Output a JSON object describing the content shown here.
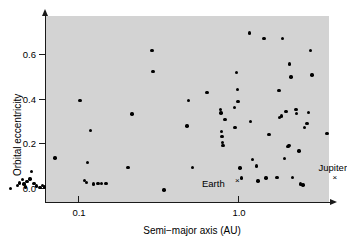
{
  "chart_data": {
    "type": "scatter",
    "title": "",
    "xlabel": "Semi−major axis (AU)",
    "ylabel": "Orbital eccentricity",
    "xscale": "log",
    "yscale": "linear",
    "xlim": [
      0.033,
      6.2
    ],
    "ylim": [
      -0.035,
      0.75
    ],
    "grid": false,
    "legend": false,
    "xticks": [
      0.1,
      1.0
    ],
    "xticklabels": [
      "0.1",
      "1.0"
    ],
    "yticks": [
      0.0,
      0.2,
      0.4,
      0.6
    ],
    "yticklabels": [
      "0.0",
      "0.2",
      "0.4",
      "0.6"
    ],
    "series": [
      {
        "name": "exoplanets",
        "marker": "filled-circle",
        "color": "#000000",
        "points": [
          [
            0.038,
            0.0
          ],
          [
            0.042,
            0.012
          ],
          [
            0.043,
            0.024
          ],
          [
            0.045,
            0.038
          ],
          [
            0.046,
            0.018
          ],
          [
            0.047,
            0.005
          ],
          [
            0.048,
            0.03
          ],
          [
            0.05,
            0.042
          ],
          [
            0.051,
            0.075
          ],
          [
            0.053,
            0.02
          ],
          [
            0.055,
            0.01
          ],
          [
            0.058,
            0.004
          ],
          [
            0.06,
            0.012
          ],
          [
            0.062,
            0.005
          ],
          [
            0.072,
            0.135
          ],
          [
            0.103,
            0.395
          ],
          [
            0.11,
            0.035
          ],
          [
            0.113,
            0.025
          ],
          [
            0.115,
            0.115
          ],
          [
            0.12,
            0.26
          ],
          [
            0.125,
            0.018
          ],
          [
            0.133,
            0.02
          ],
          [
            0.14,
            0.022
          ],
          [
            0.15,
            0.02
          ],
          [
            0.205,
            0.093
          ],
          [
            0.218,
            0.333
          ],
          [
            0.29,
            0.62
          ],
          [
            0.295,
            0.525
          ],
          [
            0.345,
            -0.008
          ],
          [
            0.48,
            0.28
          ],
          [
            0.49,
            0.395
          ],
          [
            0.52,
            0.093
          ],
          [
            0.64,
            0.43
          ],
          [
            0.78,
            0.355
          ],
          [
            0.785,
            0.338
          ],
          [
            0.79,
            0.255
          ],
          [
            0.795,
            0.232
          ],
          [
            0.8,
            0.205
          ],
          [
            0.805,
            0.192
          ],
          [
            0.83,
            0.31
          ],
          [
            0.95,
            0.363
          ],
          [
            0.96,
            0.272
          ],
          [
            0.98,
            0.52
          ],
          [
            0.99,
            0.443
          ],
          [
            1.0,
            0.39
          ],
          [
            1.03,
            0.09
          ],
          [
            1.05,
            0.045
          ],
          [
            1.18,
            0.698
          ],
          [
            1.2,
            0.3
          ],
          [
            1.23,
            0.13
          ],
          [
            1.3,
            0.1
          ],
          [
            1.33,
            0.032
          ],
          [
            1.45,
            0.672
          ],
          [
            1.5,
            0.045
          ],
          [
            1.56,
            0.24
          ],
          [
            1.75,
            0.048
          ],
          [
            1.8,
            0.44
          ],
          [
            1.82,
            0.318
          ],
          [
            1.87,
            0.325
          ],
          [
            1.9,
            0.672
          ],
          [
            1.95,
            0.133
          ],
          [
            2.0,
            0.345
          ],
          [
            2.05,
            0.188
          ],
          [
            2.08,
            0.192
          ],
          [
            2.1,
            0.558
          ],
          [
            2.15,
            0.5
          ],
          [
            2.2,
            0.048
          ],
          [
            2.3,
            0.355
          ],
          [
            2.32,
            0.337
          ],
          [
            2.4,
            0.168
          ],
          [
            2.45,
            0.018
          ],
          [
            2.55,
            0.015
          ],
          [
            2.6,
            0.272
          ],
          [
            2.7,
            0.29
          ],
          [
            2.75,
            0.34
          ],
          [
            2.85,
            0.618
          ],
          [
            2.9,
            0.508
          ],
          [
            3.6,
            0.245
          ]
        ]
      }
    ],
    "annotations": [
      {
        "label": "Earth",
        "x": 1.0,
        "y": 0.017,
        "marker": "×"
      },
      {
        "label": "Jupiter",
        "x": 5.2,
        "y": 0.048,
        "marker": "×"
      }
    ]
  }
}
